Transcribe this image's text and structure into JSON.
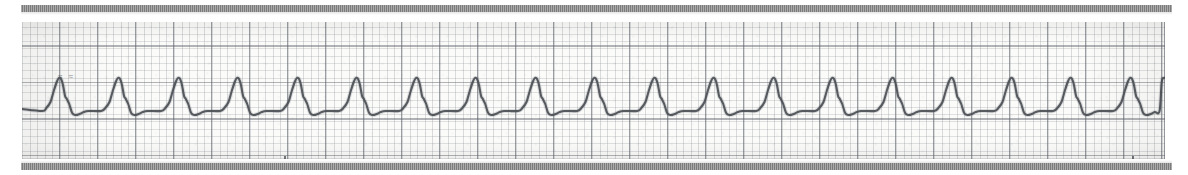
{
  "document": {
    "title": "ECG rhythm strip",
    "media": "photocopied ECG graph paper strip"
  },
  "annotation": {
    "text": "≈ ≈",
    "note": "faint illegible mark on trace baseline"
  },
  "edges": {
    "top_bar_label": "scan edge bar top",
    "bottom_bar_label": "scan edge bar bottom",
    "bar_color": "#7d7d7d"
  },
  "paper": {
    "background_color": "#fbfbfa",
    "minor_grid_color": "#787d82",
    "major_grid_color": "#5f646c",
    "minor_grid_mm_px": 7.6,
    "major_grid_mm_px": 38
  },
  "trace": {
    "color": "#4b4f55",
    "stroke_width": 2.1
  },
  "chart_data": {
    "type": "line",
    "subtitle": "Regular narrow-complex tachycardia, rounded peaked complexes with notched descending limb",
    "xlabel": "",
    "ylabel": "",
    "grid": true,
    "legend": null,
    "xlim": [
      0,
      1143
    ],
    "ylim": [
      0,
      137
    ],
    "baseline_y": 78,
    "beat_period_px": 59.5,
    "beat_count": 20,
    "first_peak_x": 38,
    "peak_y": 56,
    "trough_y": 93,
    "notch_y": 74,
    "peak_x_positions": [
      38,
      97,
      157,
      216,
      276,
      335,
      395,
      454,
      514,
      573,
      633,
      692,
      752,
      811,
      871,
      930,
      990,
      1049,
      1109,
      1143
    ],
    "time_tick_x_positions": [
      262,
      1110
    ],
    "units": {
      "paper_speed": "25 mm/s",
      "gain": "10 mm/mV"
    }
  }
}
